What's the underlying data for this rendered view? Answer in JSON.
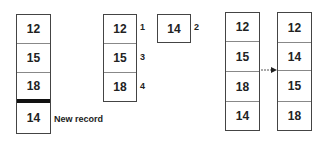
{
  "diagram": {
    "step1": {
      "records": [
        "12",
        "15",
        "18"
      ],
      "new_record": "14",
      "new_record_label": "New record"
    },
    "step2": {
      "records": [
        "12",
        "15",
        "18"
      ],
      "record_order_labels": [
        "1",
        "3",
        "4"
      ],
      "single_record": "14",
      "single_record_label": "2"
    },
    "step3": {
      "before": [
        "12",
        "15",
        "18",
        "14"
      ],
      "after": [
        "12",
        "14",
        "15",
        "18"
      ]
    }
  }
}
